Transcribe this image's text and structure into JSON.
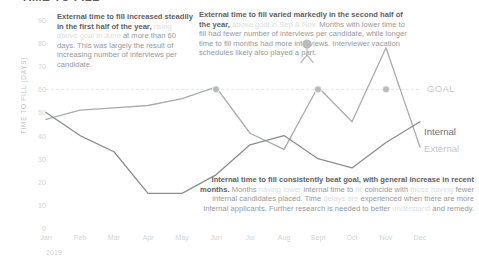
{
  "document": {
    "title": "TIME TO FILL"
  },
  "axes": {
    "y_title": "TIME TO FILL (DAYS)",
    "y_ticks": [
      "90",
      "80",
      "70",
      "60",
      "50",
      "40",
      "30",
      "20",
      "10",
      "0"
    ],
    "x_ticks": [
      "Jan",
      "Feb",
      "Mar",
      "Apr",
      "May",
      "Jun",
      "Jul",
      "Aug",
      "Sept",
      "Oct",
      "Nov",
      "Dec"
    ],
    "x_year": "2019"
  },
  "labels": {
    "goal": "GOAL",
    "internal": "Internal",
    "external": "External"
  },
  "colors": {
    "internal_line": "#8b8d8f",
    "external_line": "#a9abad",
    "goal_line": "#e3e5e7",
    "marker": "#b9bbbd",
    "text_strong": "#5f6062",
    "text_mid": "#97999b",
    "text_faint": "#dcdee0",
    "tick": "#d2d4d6"
  },
  "annotations": {
    "external_first_half": {
      "strong": "External time to fill increased steadily in the first half of the year,",
      "faint": " rising above goal in June",
      "mid": " at more than 60 days. This was largely the result of increasing number of interviews per candidate."
    },
    "external_second_half": {
      "strong": "External time to fill varied markedly in the second half of the year,",
      "faint": " above goal in Sep & Nov.",
      "mid": " Months with lower time to fill had fewer number of interviews per candidate, while longer time to fill months had more interviews. Interviewer vacation schedules likely also played a part."
    },
    "internal_summary": {
      "strong_a": "Internal time to fill consistently beat goal, with general increase in recent months.",
      "mid_a": " Months",
      "faint_a": " having lower",
      "mid_b": " internal time to",
      "faint_b": " fill",
      "mid_c": " coincide with",
      "faint_c": " those having",
      "mid_d": " fewer internal candidates placed. Time",
      "faint_d": " delays are",
      "mid_e": " experienced when there are more internal applicants. Further research is needed to better",
      "faint_e": " understand",
      "mid_f": " and remedy."
    }
  },
  "chart_data": {
    "type": "line",
    "title": "TIME TO FILL",
    "xlabel": "2019",
    "ylabel": "TIME TO FILL (DAYS)",
    "ylim": [
      0,
      90
    ],
    "grid": false,
    "legend_position": "right",
    "categories": [
      "Jan",
      "Feb",
      "Mar",
      "Apr",
      "May",
      "Jun",
      "Jul",
      "Aug",
      "Sept",
      "Oct",
      "Nov",
      "Dec"
    ],
    "series": [
      {
        "name": "External",
        "color": "#a9abad",
        "values": [
          47,
          51,
          52,
          53,
          56,
          61,
          41,
          34,
          61,
          46,
          78,
          35
        ]
      },
      {
        "name": "Internal",
        "color": "#8b8d8f",
        "values": [
          50,
          40,
          33,
          15,
          15,
          23,
          36,
          40,
          30,
          26,
          37,
          46
        ]
      }
    ],
    "reference_line": {
      "label": "GOAL",
      "value": 60,
      "style": "dashed",
      "color": "#e3e5e7"
    },
    "markers": [
      {
        "category": "Jun",
        "series": "External",
        "value": 61
      },
      {
        "category": "Sept",
        "series": "External",
        "value": 61
      },
      {
        "category": "Nov",
        "series": "External",
        "value": 78
      }
    ]
  }
}
